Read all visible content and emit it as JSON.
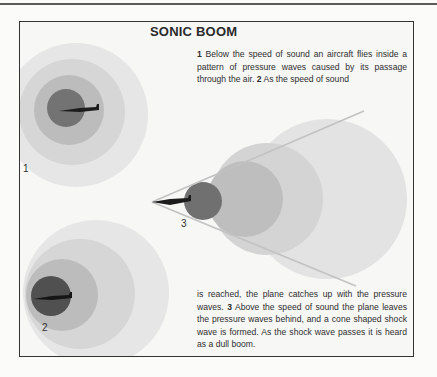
{
  "title": "SONIC BOOM",
  "text_top": {
    "n1": "1",
    "s1": " Below the speed of sound an aircraft flies inside a pattern of pressure waves caused by its passage through the air. ",
    "n2": "2",
    "s2": " As the speed of sound"
  },
  "text_bottom": {
    "s1": "is reached, the plane catches up with the pressure waves. ",
    "n3": "3",
    "s2": " Above the speed of sound the plane leaves the pressure waves behind, and a cone shaped shock wave is formed. As the shock wave passes it is heard as a dull boom."
  },
  "figure_labels": {
    "fig1": "1",
    "fig2": "2",
    "fig3": "3"
  },
  "colors": {
    "ring_outer": "#e2e2e2",
    "ring_2": "#d2d2d2",
    "ring_3": "#b8b8b8",
    "ring_inner": "#707070",
    "aircraft": "#1c1c1c",
    "cone_line": "#bdbdbd"
  }
}
